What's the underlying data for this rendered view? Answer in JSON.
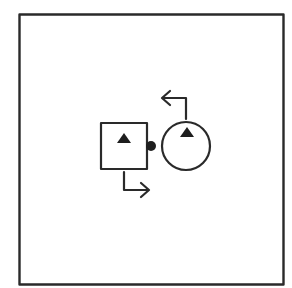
{
  "diagram": {
    "colors": {
      "stroke": "#2a2a2a",
      "fill": "#1e1e1e",
      "background": "#ffffff"
    },
    "frame": {
      "x": 19,
      "y": 14,
      "width": 264,
      "height": 270
    },
    "square": {
      "x": 101,
      "y": 123,
      "size": 46,
      "triangle": "up"
    },
    "circle": {
      "cx": 186,
      "cy": 146,
      "r": 24,
      "triangle": "up"
    },
    "connector_dot": {
      "cx": 151,
      "cy": 146,
      "r": 5
    },
    "arrows": [
      {
        "name": "top-arrow",
        "direction": "left",
        "from_shape": "circle"
      },
      {
        "name": "bottom-arrow",
        "direction": "right",
        "from_shape": "square"
      }
    ]
  }
}
